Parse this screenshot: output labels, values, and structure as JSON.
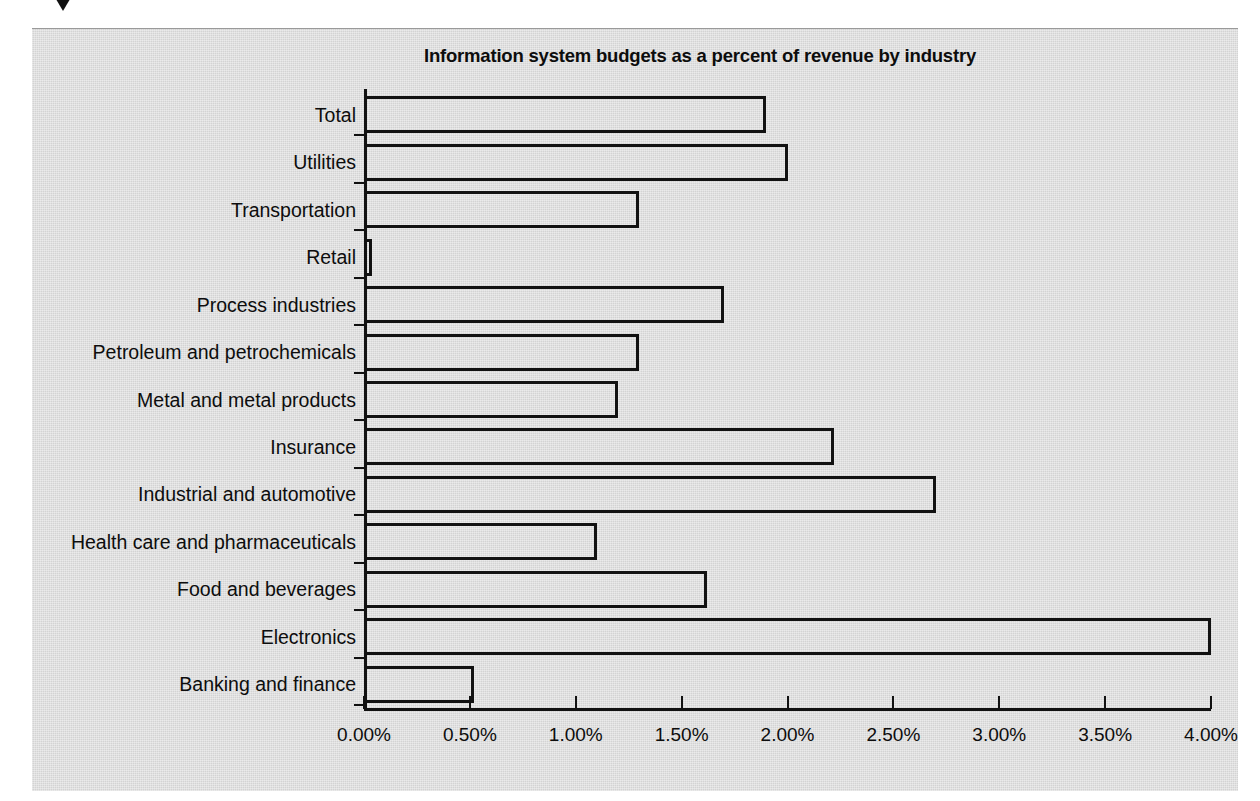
{
  "marker": {
    "icon": "triangle-down-icon"
  },
  "chart_data": {
    "type": "bar",
    "orientation": "horizontal",
    "title": "Information system budgets as a percent of revenue by industry",
    "xlabel": "",
    "ylabel": "",
    "xlim": [
      0,
      4
    ],
    "xticks": [
      0,
      0.5,
      1,
      1.5,
      2,
      2.5,
      3,
      3.5,
      4
    ],
    "xtick_labels": [
      "0.00%",
      "0.50%",
      "1.00%",
      "1.50%",
      "2.00%",
      "2.50%",
      "3.00%",
      "3.50%",
      "4.00%"
    ],
    "grid": false,
    "legend": false,
    "bar_style": {
      "fill": "none",
      "edge_color": "#111111",
      "edge_width": 3
    },
    "background_color": "#d3d3d3",
    "categories": [
      "Total",
      "Utilities",
      "Transportation",
      "Retail",
      "Process industries",
      "Petroleum and petrochemicals",
      "Metal and metal products",
      "Insurance",
      "Industrial and automotive",
      "Health care and pharmaceuticals",
      "Food and beverages",
      "Electronics",
      "Banking and finance"
    ],
    "values": [
      1.9,
      2.0,
      1.3,
      0.04,
      1.7,
      1.3,
      1.2,
      2.22,
      2.7,
      1.1,
      1.62,
      4.0,
      0.52
    ],
    "value_labels": [
      "1.90%",
      "2.00%",
      "1.30%",
      "0.04%",
      "1.70%",
      "1.30%",
      "1.20%",
      "2.22%",
      "2.70%",
      "1.10%",
      "1.62%",
      "4.00%",
      "0.52%"
    ]
  }
}
